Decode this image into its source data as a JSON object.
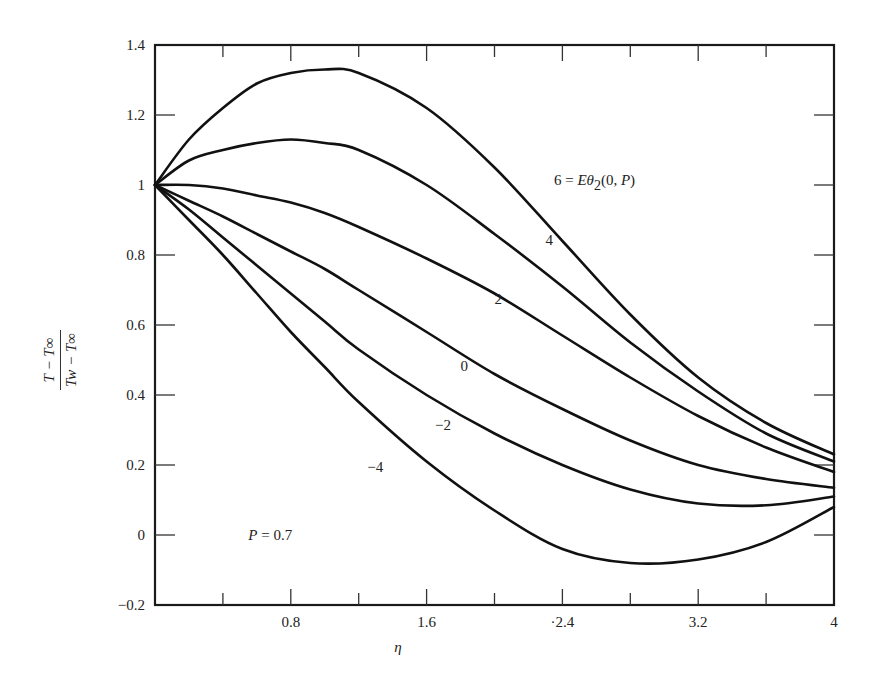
{
  "chart_data": {
    "type": "line",
    "title": "",
    "xlabel": "η",
    "ylabel": "(T − T∞) / (Tw − T∞)",
    "xlim": [
      0,
      4
    ],
    "ylim": [
      -0.2,
      1.4
    ],
    "grid": false,
    "legend_position": "inline curve labels",
    "x_ticks": [
      0.8,
      1.6,
      2.4,
      3.2,
      4
    ],
    "x_tick_labels": [
      "0.8",
      "1.6",
      "·2.4",
      "3.2",
      "4"
    ],
    "x_minor_ticks": [
      0.4,
      1.2,
      2.0,
      2.8,
      3.6
    ],
    "y_ticks": [
      -0.2,
      0,
      0.2,
      0.4,
      0.6,
      0.8,
      1,
      1.2,
      1.4
    ],
    "y_tick_labels": [
      "−0.2",
      "0",
      "0.2",
      "0.4",
      "0.6",
      "0.8",
      "1",
      "1.2",
      "1.4"
    ],
    "annotations": [
      {
        "text": "P = 0.7",
        "x": 0.55,
        "y": 0.0
      }
    ],
    "parameter_name": "Eθ2(0, P)",
    "x": [
      0,
      0.2,
      0.4,
      0.6,
      0.8,
      1.0,
      1.2,
      1.6,
      2.0,
      2.4,
      2.8,
      3.2,
      3.6,
      4.0
    ],
    "series": [
      {
        "name": "6",
        "label": "6 = Eθ2(0, P)",
        "values": [
          1.0,
          1.13,
          1.22,
          1.29,
          1.32,
          1.33,
          1.32,
          1.22,
          1.05,
          0.84,
          0.63,
          0.45,
          0.32,
          0.23
        ]
      },
      {
        "name": "4",
        "label": "4",
        "values": [
          1.0,
          1.07,
          1.1,
          1.12,
          1.13,
          1.12,
          1.1,
          1.0,
          0.86,
          0.71,
          0.55,
          0.41,
          0.29,
          0.21
        ]
      },
      {
        "name": "2",
        "label": "2",
        "values": [
          1.0,
          1.0,
          0.99,
          0.97,
          0.95,
          0.92,
          0.88,
          0.79,
          0.69,
          0.57,
          0.45,
          0.34,
          0.25,
          0.18
        ]
      },
      {
        "name": "0",
        "label": "0",
        "values": [
          1.0,
          0.955,
          0.91,
          0.86,
          0.81,
          0.76,
          0.7,
          0.58,
          0.46,
          0.36,
          0.27,
          0.2,
          0.16,
          0.135
        ]
      },
      {
        "name": "-2",
        "label": "−2",
        "values": [
          1.0,
          0.93,
          0.85,
          0.77,
          0.69,
          0.61,
          0.53,
          0.4,
          0.29,
          0.2,
          0.13,
          0.09,
          0.085,
          0.11
        ]
      },
      {
        "name": "-4",
        "label": "−4",
        "values": [
          1.0,
          0.9,
          0.8,
          0.69,
          0.58,
          0.48,
          0.38,
          0.21,
          0.07,
          -0.04,
          -0.08,
          -0.07,
          -0.02,
          0.08
        ]
      }
    ],
    "label_positions": [
      {
        "series": "6",
        "x": 2.35,
        "y": 1.0
      },
      {
        "series": "4",
        "x": 2.3,
        "y": 0.83
      },
      {
        "series": "2",
        "x": 2.0,
        "y": 0.66
      },
      {
        "series": "0",
        "x": 1.8,
        "y": 0.47
      },
      {
        "series": "-2",
        "x": 1.65,
        "y": 0.3
      },
      {
        "series": "-4",
        "x": 1.25,
        "y": 0.18
      }
    ]
  },
  "ylabel_parts": {
    "numerator": "T − T∞",
    "denominator": "Tw − T∞"
  },
  "xlabel_text": "η",
  "annotation_text": "P = 0.7"
}
